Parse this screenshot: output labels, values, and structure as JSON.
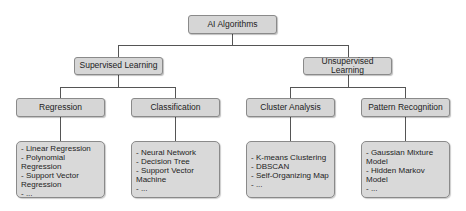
{
  "diagram": {
    "type": "tree",
    "root": {
      "label": "AI Algorithms"
    },
    "level1": [
      {
        "label": "Supervised Learning"
      },
      {
        "label": "Unsupervised Learning"
      }
    ],
    "level2": [
      {
        "label": "Regression",
        "parent": "Supervised Learning"
      },
      {
        "label": "Classification",
        "parent": "Supervised Learning"
      },
      {
        "label": "Cluster Analysis",
        "parent": "Unsupervised Learning"
      },
      {
        "label": "Pattern Recognition",
        "parent": "Unsupervised Learning"
      }
    ],
    "leaves": [
      {
        "parent": "Regression",
        "items": [
          "- Linear Regression",
          "- Polynomial Regression",
          "- Support Vector Regression",
          "- ..."
        ]
      },
      {
        "parent": "Classification",
        "items": [
          "- Neural Network",
          "- Decision Tree",
          "- Support Vector Machine",
          "- ..."
        ]
      },
      {
        "parent": "Cluster Analysis",
        "items": [
          "- K-means Clustering",
          "- DBSCAN",
          "- Self-Organizing Map",
          "- ..."
        ]
      },
      {
        "parent": "Pattern Recognition",
        "items": [
          "- Gaussian Mixture Model",
          "- Hidden Markov Model",
          "- ..."
        ]
      }
    ]
  },
  "colors": {
    "node_fill": "#d6d6d6",
    "node_border": "#8a8a8a",
    "connector": "#555555",
    "text": "#222222",
    "background": "#ffffff"
  }
}
